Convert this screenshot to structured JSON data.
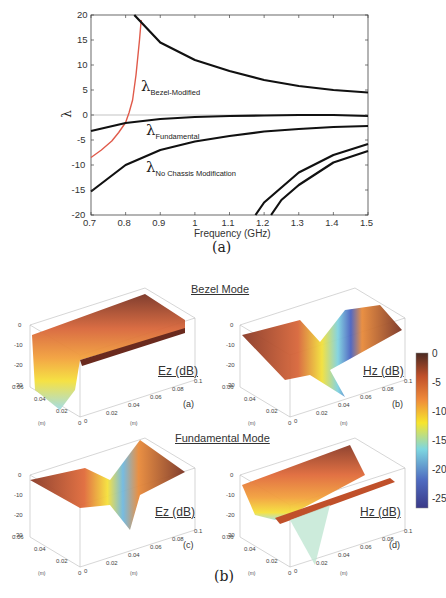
{
  "figure_a": {
    "caption": "(a)",
    "xlabel": "Frequency (GHz)",
    "ylabel": "λ",
    "x_ticks": [
      "0.7",
      "0.8",
      "0.9",
      "1",
      "1.1",
      "1.2",
      "1.3",
      "1.4",
      "1.5"
    ],
    "y_ticks": [
      "20",
      "15",
      "10",
      "5",
      "0",
      "-5",
      "-10",
      "-15",
      "-20"
    ],
    "annotations": {
      "bezel": {
        "symbol": "λ",
        "sub": "Bezel-Modified"
      },
      "fundamental": {
        "symbol": "λ",
        "sub": "Fundamental"
      },
      "nochassis": {
        "symbol": "λ",
        "sub": "No Chassis Modification"
      }
    }
  },
  "figure_b": {
    "caption": "(b)",
    "bezel_title": "Bezel Mode",
    "fundamental_title": "Fundamental Mode",
    "panels": [
      {
        "id": "a",
        "label": "Ez (dB)",
        "sub": "(a)"
      },
      {
        "id": "b",
        "label": "Hz (dB)",
        "sub": "(b)"
      },
      {
        "id": "c",
        "label": "Ez (dB)",
        "sub": "(c)"
      },
      {
        "id": "d",
        "label": "Hz (dB)",
        "sub": "(d)"
      }
    ],
    "z_ticks": [
      "0",
      "-10",
      "-20",
      "-30"
    ],
    "y_axis_ticks": [
      "0.06",
      "0.04",
      "0.02",
      "0"
    ],
    "x_axis_ticks": [
      "0",
      "0.02",
      "0.04",
      "0.06",
      "0.08",
      "0.1"
    ],
    "axis_unit": "(m)",
    "colorbar": {
      "ticks": [
        "0",
        "-5",
        "-10",
        "-15",
        "-20",
        "-25"
      ],
      "colors": [
        "#4a2a22",
        "#c0502a",
        "#ef8a3a",
        "#f7e52c",
        "#7ed7e0",
        "#4f6bc0",
        "#3a3a88"
      ]
    }
  },
  "chart_data": [
    {
      "type": "line",
      "title": "",
      "xlabel": "Frequency (GHz)",
      "ylabel": "λ",
      "xlim": [
        0.7,
        1.5
      ],
      "ylim": [
        -20,
        20
      ],
      "grid": false,
      "series": [
        {
          "name": "λ Bezel-Modified (red, dotted continuation)",
          "color": "#e05a4a",
          "x": [
            0.7,
            0.73,
            0.76,
            0.78,
            0.8,
            0.81,
            0.82,
            0.83,
            0.84,
            0.845
          ],
          "y": [
            -8.5,
            -7.0,
            -5.2,
            -3.5,
            -1.5,
            0.5,
            3.0,
            8.0,
            15.0,
            19.0
          ]
        },
        {
          "name": "upper branch",
          "color": "#111111",
          "x": [
            0.825,
            0.9,
            1.0,
            1.1,
            1.2,
            1.3,
            1.4,
            1.5
          ],
          "y": [
            20.0,
            14.5,
            11.0,
            8.8,
            7.0,
            5.8,
            5.0,
            4.5
          ]
        },
        {
          "name": "λ Fundamental",
          "color": "#111111",
          "x": [
            0.7,
            0.8,
            0.9,
            1.0,
            1.1,
            1.2,
            1.3,
            1.4,
            1.5
          ],
          "y": [
            -3.2,
            -1.6,
            -0.8,
            -0.4,
            -0.2,
            -0.1,
            0.0,
            0.0,
            -0.2
          ]
        },
        {
          "name": "λ No Chassis Modification",
          "color": "#111111",
          "x": [
            0.7,
            0.8,
            0.9,
            1.0,
            1.1,
            1.2,
            1.3,
            1.4,
            1.5
          ],
          "y": [
            -15.3,
            -10.0,
            -7.0,
            -5.3,
            -4.2,
            -3.3,
            -2.8,
            -2.4,
            -2.2
          ]
        },
        {
          "name": "higher mode 1",
          "color": "#111111",
          "x": [
            1.175,
            1.2,
            1.3,
            1.4,
            1.5
          ],
          "y": [
            -20.0,
            -17.5,
            -11.5,
            -8.0,
            -5.8
          ]
        },
        {
          "name": "higher mode 2",
          "color": "#111111",
          "x": [
            1.22,
            1.25,
            1.3,
            1.4,
            1.5
          ],
          "y": [
            -20.0,
            -17.0,
            -14.0,
            -9.5,
            -7.2
          ]
        }
      ]
    },
    {
      "type": "heatmap",
      "title": "Bezel Mode / Fundamental Mode field distributions",
      "panels": [
        "Ez (dB) Bezel Mode (a)",
        "Hz (dB) Bezel Mode (b)",
        "Ez (dB) Fundamental Mode (c)",
        "Hz (dB) Fundamental Mode (d)"
      ],
      "zlim": [
        -30,
        0
      ],
      "colorbar_range": [
        -27,
        0
      ],
      "xlabel": "(m)",
      "ylabel": "(m)"
    }
  ]
}
